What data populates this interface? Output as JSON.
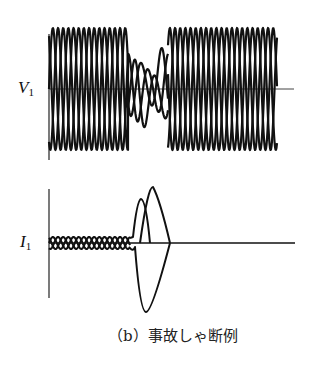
{
  "figure": {
    "caption": "（b）事故しゃ断例",
    "voltage_label": {
      "main": "V",
      "sub": "1"
    },
    "current_label": {
      "main": "I",
      "sub": "1"
    },
    "line_color": "#111111",
    "axis_color": "#333333"
  },
  "waveforms": {
    "voltage": {
      "description": "Three-phase voltage waveforms; disturbance/collapse during fault then recovery",
      "phases": 3,
      "pre_fault_cycles_visible": 6,
      "post_fault_cycles_visible": 8
    },
    "current": {
      "description": "Three-phase load current small, fault current spikes then interrupted to zero",
      "fault_peaks": 3
    }
  }
}
